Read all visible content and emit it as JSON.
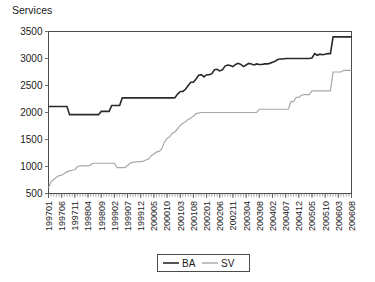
{
  "chart_data": {
    "type": "line",
    "title": "Services",
    "ylabel": "Services",
    "xlabel": "",
    "ylim": [
      500,
      3500
    ],
    "yticks": [
      500,
      1000,
      1500,
      2000,
      2500,
      3000,
      3500
    ],
    "grid": false,
    "legend_position": "bottom-center",
    "xtick_labels": [
      "199701",
      "199706",
      "199711",
      "199804",
      "199809",
      "199902",
      "199907",
      "199912",
      "200005",
      "200010",
      "200103",
      "200108",
      "200201",
      "200206",
      "200211",
      "200304",
      "200308",
      "200402",
      "200407",
      "200412",
      "200505",
      "200510",
      "200603",
      "200608"
    ],
    "x_index_of_labels": [
      0,
      5,
      10,
      15,
      20,
      25,
      30,
      35,
      40,
      45,
      50,
      55,
      60,
      65,
      70,
      75,
      80,
      85,
      90,
      95,
      100,
      105,
      110,
      115
    ],
    "x_count": 116,
    "series": [
      {
        "name": "BA",
        "color": "#2a2a2a",
        "width": 1.6,
        "values": [
          2110,
          2110,
          2110,
          2110,
          2110,
          2110,
          2110,
          2110,
          1960,
          1960,
          1960,
          1960,
          1960,
          1960,
          1960,
          1960,
          1960,
          1960,
          1960,
          1960,
          2020,
          2020,
          2020,
          2020,
          2130,
          2130,
          2130,
          2130,
          2270,
          2270,
          2270,
          2270,
          2270,
          2270,
          2270,
          2270,
          2270,
          2270,
          2270,
          2270,
          2270,
          2270,
          2270,
          2270,
          2270,
          2270,
          2270,
          2270,
          2275,
          2340,
          2390,
          2390,
          2430,
          2500,
          2560,
          2560,
          2620,
          2690,
          2700,
          2660,
          2700,
          2700,
          2720,
          2790,
          2800,
          2770,
          2790,
          2860,
          2880,
          2870,
          2850,
          2890,
          2910,
          2890,
          2850,
          2880,
          2910,
          2900,
          2880,
          2900,
          2890,
          2890,
          2900,
          2900,
          2910,
          2930,
          2950,
          2980,
          2990,
          2990,
          3000,
          3000,
          3000,
          3000,
          3000,
          3000,
          3000,
          3000,
          3000,
          3000,
          3010,
          3090,
          3060,
          3080,
          3070,
          3080,
          3090,
          3090,
          3400,
          3400,
          3400,
          3400,
          3400,
          3400,
          3400,
          3400
        ]
      },
      {
        "name": "SV",
        "color": "#a8a8a8",
        "width": 1.2,
        "values": [
          600,
          720,
          760,
          800,
          830,
          840,
          870,
          900,
          920,
          930,
          940,
          1000,
          1010,
          1010,
          1010,
          1010,
          1030,
          1060,
          1060,
          1060,
          1060,
          1060,
          1060,
          1060,
          1060,
          1060,
          980,
          980,
          980,
          980,
          1020,
          1060,
          1080,
          1080,
          1090,
          1090,
          1100,
          1120,
          1140,
          1200,
          1230,
          1270,
          1280,
          1330,
          1450,
          1520,
          1550,
          1620,
          1640,
          1700,
          1760,
          1800,
          1830,
          1870,
          1900,
          1930,
          1980,
          1990,
          2000,
          2000,
          2000,
          2000,
          2000,
          2000,
          2000,
          2000,
          2000,
          2000,
          2000,
          2000,
          2000,
          2000,
          2000,
          2000,
          2000,
          2000,
          2000,
          2000,
          2000,
          2000,
          2060,
          2060,
          2060,
          2060,
          2060,
          2060,
          2060,
          2060,
          2060,
          2060,
          2060,
          2060,
          2200,
          2200,
          2280,
          2280,
          2320,
          2330,
          2330,
          2330,
          2400,
          2400,
          2400,
          2400,
          2400,
          2400,
          2400,
          2400,
          2750,
          2750,
          2750,
          2750,
          2780,
          2780,
          2780,
          2780
        ]
      }
    ]
  },
  "legend": {
    "entries": [
      {
        "label": "BA"
      },
      {
        "label": "SV"
      }
    ]
  }
}
